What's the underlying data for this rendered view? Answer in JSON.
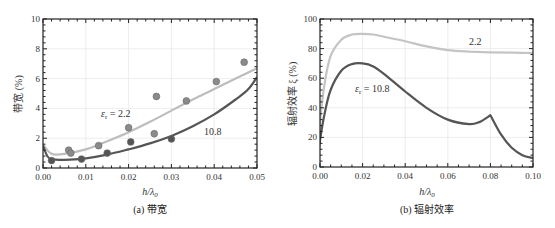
{
  "chart_data": [
    {
      "type": "line",
      "panel": "a",
      "caption": "(a) 带宽",
      "title": "",
      "xlabel": "h/λ0",
      "ylabel": "带宽 (%)",
      "xlim": [
        0.0,
        0.05
      ],
      "ylim": [
        0,
        10
      ],
      "xticks": [
        "0.00",
        "0.01",
        "0.02",
        "0.03",
        "0.04",
        "0.05"
      ],
      "yticks": [
        "0",
        "2",
        "4",
        "6",
        "8",
        "10"
      ],
      "grid": true,
      "series": [
        {
          "name": "εr = 2.2 (theory)",
          "color": "#bdbdbd",
          "x": [
            0.0,
            0.001,
            0.002,
            0.003,
            0.005,
            0.01,
            0.015,
            0.02,
            0.025,
            0.03,
            0.035,
            0.04,
            0.045,
            0.05
          ],
          "y": [
            1.6,
            1.2,
            0.95,
            0.9,
            0.95,
            1.25,
            1.8,
            2.4,
            3.1,
            3.85,
            4.6,
            5.3,
            6.0,
            6.7
          ]
        },
        {
          "name": "εr = 10.8 (theory)",
          "color": "#555555",
          "x": [
            0.0,
            0.001,
            0.002,
            0.005,
            0.01,
            0.015,
            0.02,
            0.025,
            0.03,
            0.035,
            0.04,
            0.045,
            0.048,
            0.05
          ],
          "y": [
            1.5,
            0.8,
            0.6,
            0.55,
            0.65,
            0.9,
            1.25,
            1.65,
            2.15,
            2.8,
            3.6,
            4.6,
            5.3,
            6.1
          ]
        },
        {
          "name": "εr = 2.2 (measured)",
          "marker": "circle",
          "color": "#8a8a8a",
          "x": [
            0.006,
            0.0065,
            0.013,
            0.02,
            0.026,
            0.0265,
            0.0335,
            0.0405,
            0.047
          ],
          "y": [
            1.2,
            1.0,
            1.5,
            2.7,
            2.3,
            4.8,
            4.5,
            5.8,
            7.1
          ]
        },
        {
          "name": "εr = 10.8 (measured)",
          "marker": "circle",
          "color": "#555555",
          "x": [
            0.002,
            0.009,
            0.015,
            0.0205,
            0.03
          ],
          "y": [
            0.5,
            0.6,
            1.0,
            1.75,
            1.95
          ]
        }
      ],
      "annotations": [
        {
          "text": "εr = 2.2",
          "x": 0.0125,
          "y": 3.5
        },
        {
          "text": "10.8",
          "x": 0.037,
          "y": 2.4
        }
      ]
    },
    {
      "type": "line",
      "panel": "b",
      "caption": "(b) 辐射效率",
      "title": "",
      "xlabel": "h/λ0",
      "ylabel": "辐射效率 ξ (%)",
      "xlim": [
        0.0,
        0.1
      ],
      "ylim": [
        0,
        100
      ],
      "xticks": [
        "0.00",
        "0.02",
        "0.04",
        "0.06",
        "0.08",
        "0.10"
      ],
      "yticks": [
        "0",
        "20",
        "40",
        "60",
        "80",
        "100"
      ],
      "grid": true,
      "series": [
        {
          "name": "εr = 2.2",
          "color": "#c4c4c4",
          "x": [
            -0.001,
            0.0,
            0.002,
            0.005,
            0.01,
            0.015,
            0.02,
            0.025,
            0.03,
            0.04,
            0.05,
            0.06,
            0.07,
            0.08,
            0.09,
            0.1
          ],
          "y": [
            10,
            30,
            55,
            75,
            86,
            89.5,
            90,
            89.5,
            88,
            85,
            81.5,
            79,
            78,
            77.5,
            77.2,
            77
          ]
        },
        {
          "name": "εr = 10.8",
          "color": "#555555",
          "x": [
            -0.001,
            0.0,
            0.002,
            0.005,
            0.01,
            0.015,
            0.02,
            0.025,
            0.03,
            0.04,
            0.05,
            0.06,
            0.07,
            0.075,
            0.08,
            0.085,
            0.09,
            0.095,
            0.1
          ],
          "y": [
            5,
            18,
            35,
            52,
            65,
            69.5,
            70,
            68,
            63,
            51,
            40,
            32,
            29,
            30.5,
            35,
            22,
            13,
            8,
            6
          ]
        }
      ],
      "annotations": [
        {
          "text": "2.2",
          "x": 0.067,
          "y": 84
        },
        {
          "text": "εr = 10.8",
          "x": 0.016,
          "y": 52
        }
      ]
    }
  ],
  "panel_a": {
    "caption": "(a) 带宽",
    "xlabel": "h/λ",
    "xlabel_sub": "0",
    "ylabel": "带宽 (%)",
    "label_er": "ε",
    "label_er_sub": "r",
    "label_22": " = 2.2",
    "label_108": "10.8"
  },
  "panel_b": {
    "caption": "(b) 辐射效率",
    "xlabel": "h/λ",
    "xlabel_sub": "0",
    "ylabel": "辐射效率 ξ (%)",
    "label_22": "2.2",
    "label_er": "ε",
    "label_er_sub": "r",
    "label_108": " = 10.8"
  }
}
